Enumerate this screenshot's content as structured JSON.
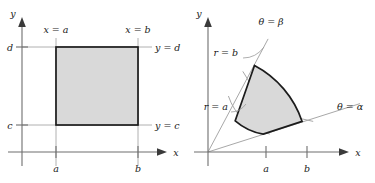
{
  "figure": {
    "background_color": "#ffffff",
    "region_fill_color": "#d9d9d9",
    "region_edge_color": "#1c1c1c",
    "axis_color": "#6e6e6e",
    "guide_color": "#b0b0b0"
  },
  "panels": [
    {
      "id": "cartesian",
      "name": "rectangular-region-panel",
      "axes": {
        "x_label": "x",
        "y_label": "y",
        "origin": {
          "x": 22,
          "y": 152
        }
      },
      "ticks": {
        "x": [
          {
            "label": "a",
            "value_x": 56
          },
          {
            "label": "b",
            "value_x": 138
          }
        ],
        "y": [
          {
            "label": "d",
            "value_y": 47
          },
          {
            "label": "c",
            "value_y": 125
          }
        ]
      },
      "boundary_labels": [
        {
          "text": "x = a",
          "name": "label-x-equals-a"
        },
        {
          "text": "x = b",
          "name": "label-x-equals-b"
        },
        {
          "text": "y = d",
          "name": "label-y-equals-d"
        },
        {
          "text": "y = c",
          "name": "label-y-equals-c"
        }
      ],
      "region": {
        "type": "rectangle",
        "left": 56,
        "right": 138,
        "top": 47,
        "bottom": 125
      }
    },
    {
      "id": "polar",
      "name": "polar-sector-panel",
      "axes": {
        "x_label": "x",
        "y_label": "y",
        "origin": {
          "x": 20,
          "y": 152
        }
      },
      "ticks": {
        "x": [
          {
            "label": "a",
            "value_x": 78
          },
          {
            "label": "b",
            "value_x": 119
          }
        ]
      },
      "boundary_labels": [
        {
          "text": "θ = β",
          "name": "label-theta-equals-beta"
        },
        {
          "text": "θ = α",
          "name": "label-theta-equals-alpha"
        },
        {
          "text": "r = b",
          "name": "label-r-equals-b"
        },
        {
          "text": "r = a",
          "name": "label-r-equals-a"
        }
      ],
      "region": {
        "type": "annular-sector",
        "r_inner": 58,
        "r_outer": 99,
        "theta_alpha_deg": 18,
        "theta_beta_deg": 62
      }
    }
  ]
}
